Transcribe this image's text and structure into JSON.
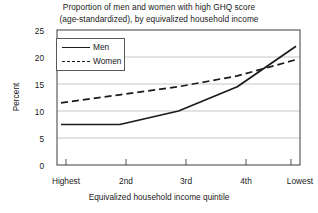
{
  "chart_data": {
    "type": "line",
    "title": "Proportion of men and women with high GHQ score (age-standardized), by equivalized household income",
    "title_lines": [
      "Proportion of men and women with high GHQ score",
      "(age-standardized), by equivalized household income"
    ],
    "xlabel": "Equivalized household income quintile",
    "ylabel": "Percent",
    "categories": [
      "Highest",
      "2nd",
      "3rd",
      "4th",
      "Lowest"
    ],
    "ylim": [
      0,
      25
    ],
    "yticks": [
      0,
      5,
      10,
      15,
      20,
      25
    ],
    "ytick_labels": [
      "0",
      "5",
      "10",
      "15",
      "20",
      "25"
    ],
    "grid": true,
    "legend_position": "upper-left",
    "series": [
      {
        "name": "Men",
        "style": "solid",
        "color": "#1a1a1a",
        "values": [
          7.5,
          7.5,
          10.0,
          14.5,
          22.0
        ]
      },
      {
        "name": "Women",
        "style": "dashed",
        "color": "#1a1a1a",
        "values": [
          11.5,
          13.0,
          14.5,
          16.5,
          19.5
        ]
      }
    ]
  },
  "legend": {
    "items": [
      {
        "label": "Men",
        "style": "solid"
      },
      {
        "label": "Women",
        "style": "dashed"
      }
    ]
  },
  "axis": {
    "y_title": "Percent",
    "x_title": "Equivalized household income quintile"
  }
}
